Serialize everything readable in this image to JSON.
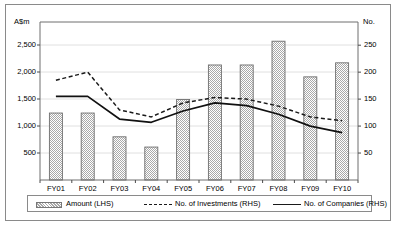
{
  "chart_data": {
    "type": "bar",
    "title": "",
    "subtitle": "",
    "categories": [
      "FY01",
      "FY02",
      "FY03",
      "FY04",
      "FY05",
      "FY06",
      "FY07",
      "FY08",
      "FY09",
      "FY10"
    ],
    "xlabel": "",
    "left_axis": {
      "label": "A$m",
      "ticks": [
        "500",
        "1,000",
        "1,500",
        "2,000",
        "2,500"
      ],
      "tick_values": [
        500,
        1000,
        1500,
        2000,
        2500
      ],
      "min": 0,
      "max": 2926
    },
    "right_axis": {
      "label": "No.",
      "ticks": [
        "50",
        "100",
        "150",
        "200",
        "250"
      ],
      "tick_values": [
        50,
        100,
        150,
        200,
        250
      ],
      "min": 0,
      "max": 293
    },
    "grid": true,
    "legend_position": "bottom",
    "series": [
      {
        "name": "Amount (LHS)",
        "type": "bar",
        "axis": "left",
        "style": "hatched-grey",
        "color": "#b8b8b8",
        "values": [
          1240,
          1240,
          800,
          610,
          1490,
          2130,
          2130,
          2570,
          1910,
          2170
        ]
      },
      {
        "name": "No. of Investments (RHS)",
        "type": "line",
        "axis": "right",
        "style": "dashed",
        "color": "#1a1a1a",
        "values": [
          185,
          200,
          130,
          117,
          143,
          153,
          150,
          137,
          117,
          110
        ]
      },
      {
        "name": "No. of Companies (RHS)",
        "type": "line",
        "axis": "right",
        "style": "solid",
        "color": "#1a1a1a",
        "values": [
          155,
          155,
          113,
          107,
          128,
          143,
          138,
          122,
          100,
          88
        ]
      }
    ]
  },
  "legend": {
    "items": [
      {
        "label": "Amount (LHS)",
        "symbol": "hatched-bar-swatch"
      },
      {
        "label": "No. of Investments (RHS)",
        "symbol": "dashed-line-swatch"
      },
      {
        "label": "No. of Companies (RHS)",
        "symbol": "solid-line-swatch"
      }
    ]
  }
}
